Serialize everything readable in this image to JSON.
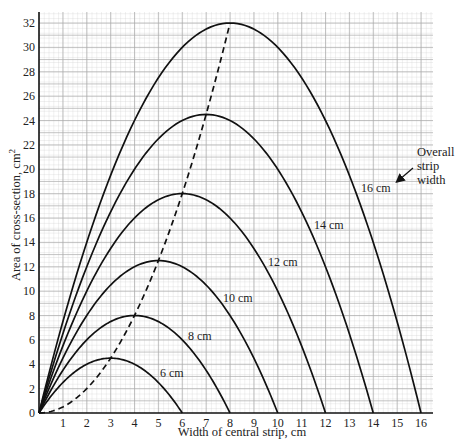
{
  "chart_data": {
    "type": "line",
    "title": "",
    "xlabel": "Width of central strip, cm",
    "ylabel": "Area of cross-section, cm²",
    "xlim": [
      0,
      16
    ],
    "ylim": [
      0,
      32
    ],
    "x_ticks": [
      "1",
      "2",
      "3",
      "4",
      "5",
      "6",
      "7",
      "8",
      "9",
      "10",
      "11",
      "12",
      "13",
      "14",
      "15",
      "16"
    ],
    "y_ticks": [
      "0",
      "2",
      "4",
      "6",
      "8",
      "10",
      "12",
      "14",
      "16",
      "18",
      "20",
      "22",
      "24",
      "26",
      "28",
      "30",
      "32"
    ],
    "grid": true,
    "series": [
      {
        "name": "6 cm",
        "overall_width": 6,
        "x": [
          0,
          1,
          2,
          3,
          4,
          5,
          6
        ],
        "values": [
          0,
          2.5,
          4,
          4.5,
          4,
          2.5,
          0
        ],
        "peak": [
          3,
          4.5
        ]
      },
      {
        "name": "8 cm",
        "overall_width": 8,
        "x": [
          0,
          1,
          2,
          3,
          4,
          5,
          6,
          7,
          8
        ],
        "values": [
          0,
          3.5,
          6,
          7.5,
          8,
          7.5,
          6,
          3.5,
          0
        ],
        "peak": [
          4,
          8
        ]
      },
      {
        "name": "10 cm",
        "overall_width": 10,
        "x": [
          0,
          1,
          2,
          3,
          4,
          5,
          6,
          7,
          8,
          9,
          10
        ],
        "values": [
          0,
          4.5,
          8,
          10.5,
          12,
          12.5,
          12,
          10.5,
          8,
          4.5,
          0
        ],
        "peak": [
          5,
          12.5
        ]
      },
      {
        "name": "12 cm",
        "overall_width": 12,
        "x": [
          0,
          2,
          4,
          6,
          8,
          10,
          12
        ],
        "values": [
          0,
          10,
          16,
          18,
          16,
          10,
          0
        ],
        "peak": [
          6,
          18
        ]
      },
      {
        "name": "14 cm",
        "overall_width": 14,
        "x": [
          0,
          2,
          4,
          6,
          7,
          8,
          10,
          12,
          14
        ],
        "values": [
          0,
          12,
          20,
          24,
          24.5,
          24,
          20,
          12,
          0
        ],
        "peak": [
          7,
          24.5
        ]
      },
      {
        "name": "16 cm",
        "overall_width": 16,
        "x": [
          0,
          2,
          4,
          6,
          8,
          10,
          12,
          14,
          16
        ],
        "values": [
          0,
          14,
          24,
          30,
          32,
          30,
          24,
          14,
          0
        ],
        "peak": [
          8,
          32
        ]
      },
      {
        "name": "Locus of maxima (dashed)",
        "style": "dashed",
        "x": [
          0,
          1,
          2,
          3,
          4,
          5,
          6,
          7,
          8
        ],
        "values": [
          0,
          0.5,
          2,
          4.5,
          8,
          12.5,
          18,
          24.5,
          32
        ]
      }
    ],
    "annotations": [
      {
        "text": "Overall strip width",
        "arrow_to": "16 cm"
      }
    ]
  },
  "labels": {
    "xlabel": "Width of central strip, cm",
    "ylabel": "Area of cross-section, cm",
    "ylabel_sup": "2",
    "annotation_line1": "Overall",
    "annotation_line2": "strip",
    "annotation_line3": "width",
    "curve_6": "6 cm",
    "curve_8": "8 cm",
    "curve_10": "10 cm",
    "curve_12": "12 cm",
    "curve_14": "14 cm",
    "curve_16": "16 cm"
  }
}
